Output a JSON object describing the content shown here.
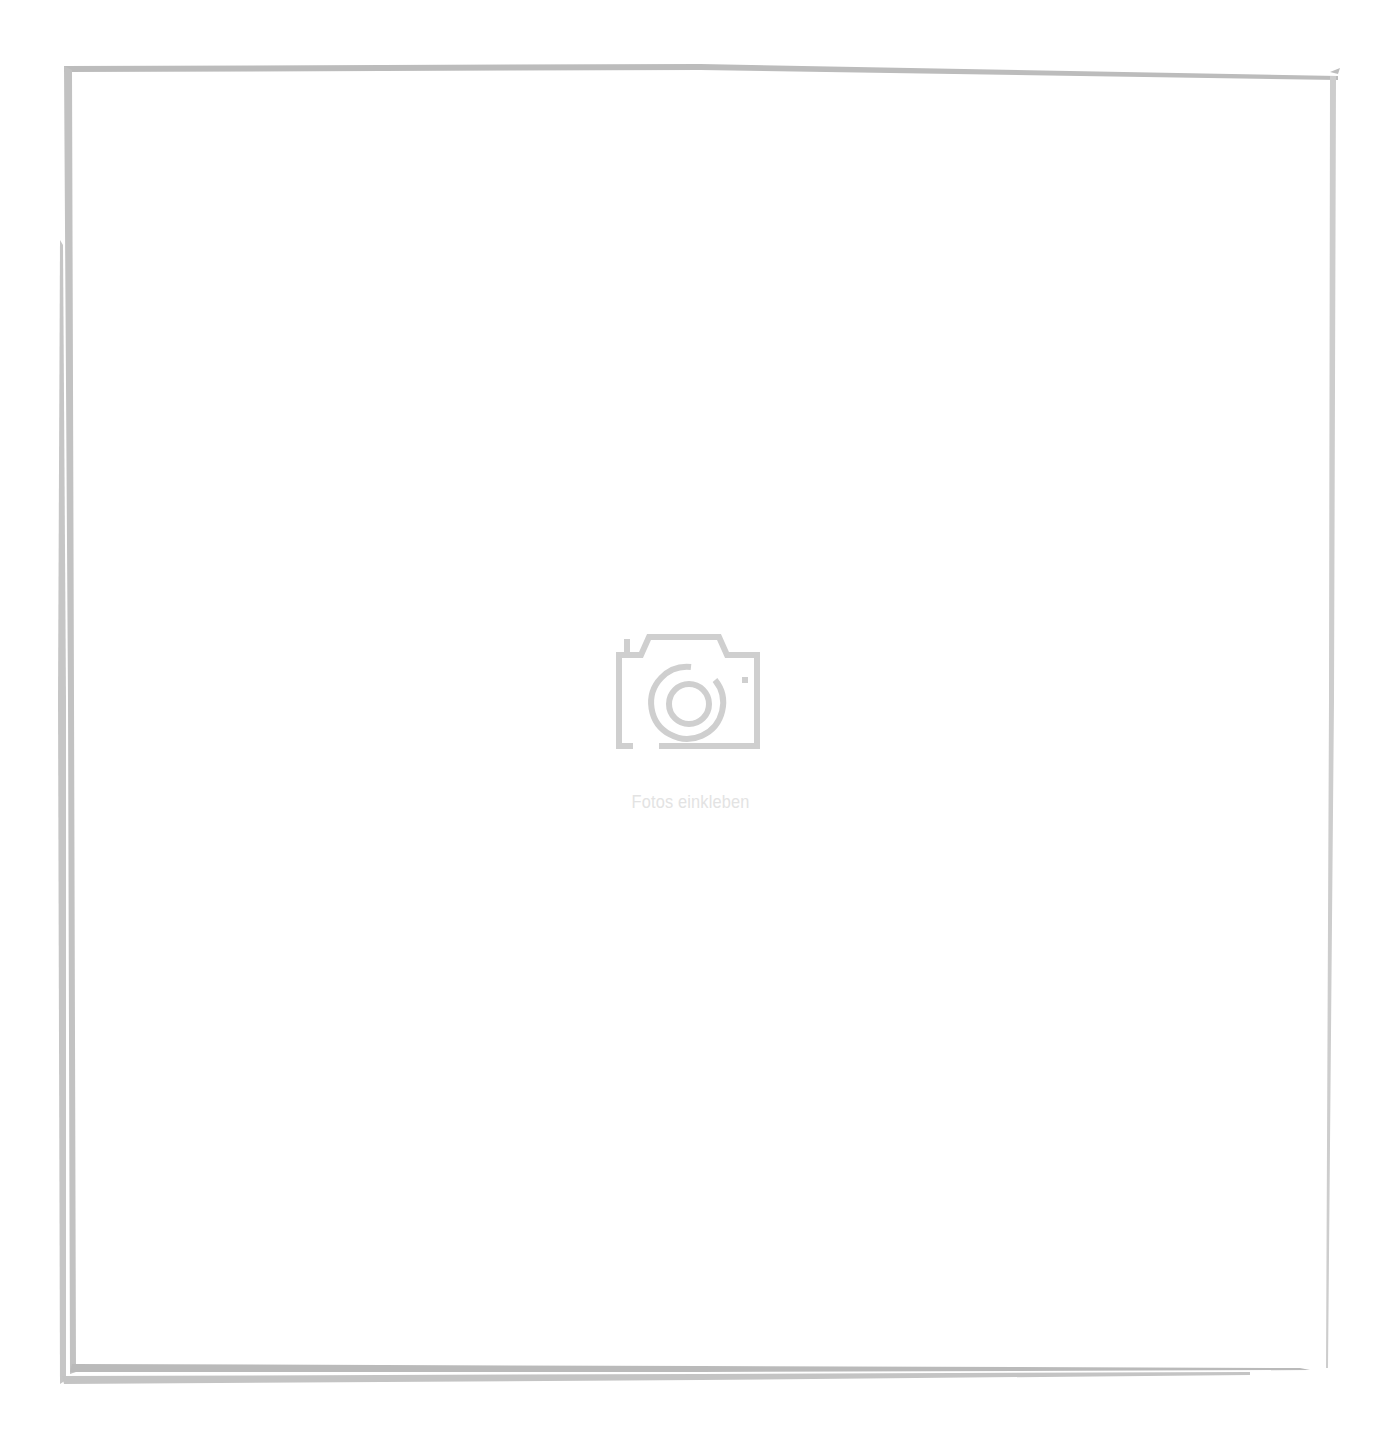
{
  "photo_frame": {
    "placeholder": {
      "icon": "camera-icon",
      "label": "Fotos einkleben"
    },
    "colors": {
      "frame_stroke": "#bdbdbd",
      "frame_stroke_light": "#d0d0d0",
      "icon_stroke": "#cfcfcf",
      "label_text": "#e3e3e3",
      "background": "#ffffff"
    }
  }
}
